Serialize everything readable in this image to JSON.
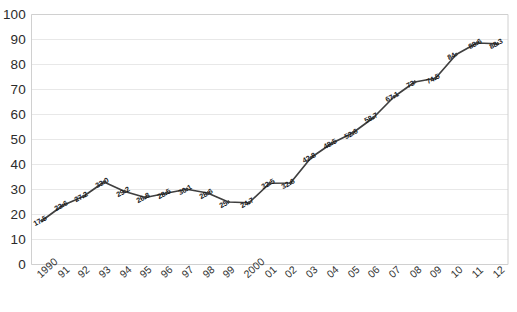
{
  "chart_data": {
    "type": "line",
    "title": "",
    "xlabel": "",
    "ylabel": "",
    "ylim": [
      0,
      100
    ],
    "ytick_step": 10,
    "grid": true,
    "legend": false,
    "legend_position": "none",
    "line_color": "#3f3f3f",
    "marker": "diamond",
    "categories": [
      "1990",
      "91",
      "92",
      "93",
      "94",
      "95",
      "96",
      "97",
      "98",
      "99",
      "2000",
      "01",
      "02",
      "03",
      "04",
      "05",
      "06",
      "07",
      "08",
      "09",
      "10",
      "11",
      "12"
    ],
    "values": [
      17.5,
      23.6,
      27.2,
      33.0,
      29.2,
      26.8,
      28.5,
      30.1,
      28.6,
      25.0,
      24.7,
      32.5,
      32.6,
      42.8,
      48.5,
      52.6,
      58.7,
      67.1,
      73.0,
      74.5,
      84.0,
      88.6,
      88.3
    ],
    "data_labels": [
      "17.5",
      "23.6",
      "27.2",
      "33.0",
      "29.2",
      "26.8",
      "28.5",
      "30.1",
      "28.6",
      "25",
      "24.7",
      "32.5",
      "32.6",
      "42.8",
      "48.5",
      "52.6",
      "58.7",
      "67.1",
      "73",
      "74.5",
      "84",
      "88.6",
      "88.3"
    ],
    "ytick_labels": [
      "100",
      "90",
      "80",
      "70",
      "60",
      "50",
      "40",
      "30",
      "20",
      "10",
      "0"
    ],
    "ytick_values": [
      100,
      90,
      80,
      70,
      60,
      50,
      40,
      30,
      20,
      10,
      0
    ]
  }
}
